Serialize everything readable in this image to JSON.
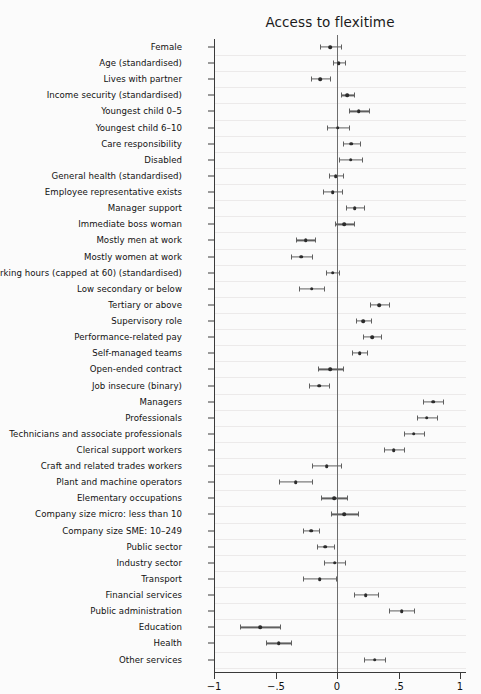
{
  "chart_data": {
    "type": "scatter",
    "title": "Access to flexitime",
    "subtitle": "",
    "xlabel": "",
    "ylabel": "",
    "xlim": [
      -1.15,
      1.15
    ],
    "xticks": [
      -1,
      -0.5,
      0,
      0.5,
      1
    ],
    "xtick_labels": [
      "−1",
      "−.5",
      "0",
      ".5",
      "1"
    ],
    "grid": true,
    "legend": "none",
    "reference_line": 0,
    "point_color": "#2b2b2b",
    "ci_color": "#5f5f5f",
    "axis_color": "#3a3a3a",
    "background": "#fbfbfb",
    "categories": [
      "Female",
      "Age (standardised)",
      "Lives with partner",
      "Income security (standardised)",
      "Youngest child 0–5",
      "Youngest child 6–10",
      "Care responsibility",
      "Disabled",
      "General health (standardised)",
      "Employee representative exists",
      "Manager support",
      "Immediate boss woman",
      "Mostly men at work",
      "Mostly women at work",
      "Working hours (capped at 60) (standardised)",
      "Low secondary or below",
      "Tertiary or above",
      "Supervisory role",
      "Performance-related pay",
      "Self-managed teams",
      "Open-ended contract",
      "Job insecure (binary)",
      "Managers",
      "Professionals",
      "Technicians and associate professionals",
      "Clerical support workers",
      "Craft and related trades workers",
      "Plant and machine operators",
      "Elementary occupations",
      "Company size micro: less than 10",
      "Company size SME: 10–249",
      "Public sector",
      "Industry sector",
      "Transport",
      "Financial services",
      "Public administration",
      "Education",
      "Health",
      "Other services"
    ],
    "estimates": [
      -0.055,
      0.015,
      -0.135,
      0.085,
      0.175,
      0.005,
      0.115,
      0.11,
      -0.01,
      -0.035,
      0.145,
      0.06,
      -0.255,
      -0.29,
      -0.035,
      -0.205,
      0.345,
      0.215,
      0.285,
      0.185,
      -0.055,
      -0.145,
      0.78,
      0.73,
      0.625,
      0.46,
      -0.085,
      -0.335,
      -0.025,
      0.06,
      -0.21,
      -0.095,
      -0.02,
      -0.14,
      0.235,
      0.525,
      -0.625,
      -0.475,
      0.305
    ],
    "ci_lower": [
      -0.135,
      -0.03,
      -0.215,
      0.035,
      0.095,
      -0.085,
      0.045,
      0.015,
      -0.065,
      -0.11,
      0.07,
      -0.015,
      -0.335,
      -0.375,
      -0.09,
      -0.305,
      0.27,
      0.155,
      0.215,
      0.125,
      -0.155,
      -0.225,
      0.7,
      0.65,
      0.545,
      0.38,
      -0.2,
      -0.47,
      -0.13,
      -0.05,
      -0.275,
      -0.165,
      -0.105,
      -0.275,
      0.135,
      0.42,
      -0.79,
      -0.58,
      0.22
    ],
    "ci_upper": [
      0.03,
      0.065,
      -0.055,
      0.135,
      0.26,
      0.095,
      0.185,
      0.205,
      0.045,
      0.04,
      0.22,
      0.135,
      -0.175,
      -0.205,
      0.02,
      -0.105,
      0.42,
      0.275,
      0.355,
      0.245,
      0.045,
      -0.065,
      0.86,
      0.815,
      0.705,
      0.545,
      0.03,
      -0.2,
      0.08,
      0.17,
      -0.145,
      -0.025,
      0.065,
      -0.005,
      0.335,
      0.625,
      -0.46,
      -0.37,
      0.39
    ]
  }
}
